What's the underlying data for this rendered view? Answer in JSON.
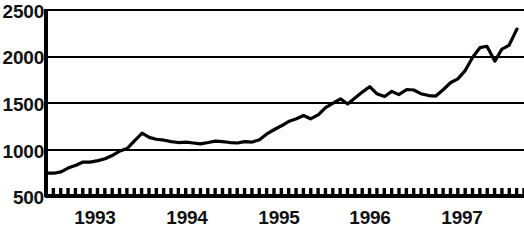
{
  "chart_data": {
    "type": "line",
    "title": "",
    "subtitle": "",
    "xlabel": "",
    "ylabel": "",
    "grid": true,
    "legend": null,
    "legend_position": "none",
    "line_color": "#000000",
    "background_color": "#ffffff",
    "axis_color": "#000000",
    "gridline_color": "#000000",
    "ylim": [
      500,
      2500
    ],
    "y_ticks": [
      500,
      1000,
      1500,
      2000,
      2500
    ],
    "y_tick_labels": [
      "500",
      "1000",
      "1500",
      "2000",
      "2500"
    ],
    "xlim": [
      1992.58,
      1998.0
    ],
    "x_ticks": [
      1993,
      1994,
      1995,
      1996,
      1997
    ],
    "x_tick_labels": [
      "1993",
      "1994",
      "1995",
      "1996",
      "1997"
    ],
    "x_minor_tick_count": 65,
    "x_minor_tick_note": "monthly tick marks along the baseline",
    "series": [
      {
        "name": "index",
        "x": [
          1992.58,
          1992.67,
          1992.75,
          1992.83,
          1992.92,
          1993.0,
          1993.08,
          1993.17,
          1993.25,
          1993.33,
          1993.42,
          1993.5,
          1993.58,
          1993.67,
          1993.75,
          1993.83,
          1993.92,
          1994.0,
          1994.08,
          1994.17,
          1994.25,
          1994.33,
          1994.42,
          1994.5,
          1994.58,
          1994.67,
          1994.75,
          1994.83,
          1994.92,
          1995.0,
          1995.08,
          1995.17,
          1995.25,
          1995.33,
          1995.42,
          1995.5,
          1995.58,
          1995.67,
          1995.75,
          1995.83,
          1995.92,
          1996.0,
          1996.08,
          1996.17,
          1996.25,
          1996.33,
          1996.42,
          1996.5,
          1996.58,
          1996.67,
          1996.75,
          1996.83,
          1996.92,
          1997.0,
          1997.08,
          1997.17,
          1997.25,
          1997.33,
          1997.42,
          1997.5,
          1997.58,
          1997.67,
          1997.75,
          1997.83,
          1997.92
        ],
        "values": [
          745,
          745,
          760,
          800,
          830,
          865,
          865,
          880,
          900,
          935,
          985,
          1010,
          1090,
          1175,
          1130,
          1110,
          1100,
          1085,
          1075,
          1080,
          1070,
          1060,
          1075,
          1090,
          1085,
          1075,
          1070,
          1085,
          1080,
          1105,
          1165,
          1215,
          1255,
          1300,
          1330,
          1365,
          1330,
          1375,
          1450,
          1495,
          1545,
          1490,
          1550,
          1620,
          1675,
          1600,
          1570,
          1625,
          1590,
          1645,
          1640,
          1600,
          1580,
          1575,
          1640,
          1720,
          1760,
          1845,
          1995,
          2095,
          2110,
          1950,
          2080,
          2120,
          2295
        ]
      }
    ]
  },
  "axes": {
    "y_labels": [
      {
        "text": "2500",
        "value": 2500
      },
      {
        "text": "2000",
        "value": 2000
      },
      {
        "text": "1500",
        "value": 1500
      },
      {
        "text": "1000",
        "value": 1000
      },
      {
        "text": "500",
        "value": 500
      }
    ],
    "x_labels": [
      {
        "text": "1993",
        "value": 1993
      },
      {
        "text": "1994",
        "value": 1994
      },
      {
        "text": "1995",
        "value": 1995
      },
      {
        "text": "1996",
        "value": 1996
      },
      {
        "text": "1997",
        "value": 1997
      }
    ]
  }
}
